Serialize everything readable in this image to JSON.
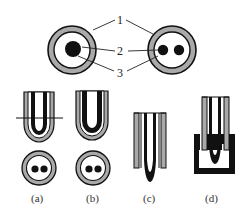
{
  "figure": {
    "callouts": {
      "one": "1",
      "two": "2",
      "three": "3"
    },
    "captions": {
      "a": "(a)",
      "b": "(b)",
      "c": "(c)",
      "d": "(d)"
    },
    "colors": {
      "outer_ring": "#a9a9a9",
      "stroke": "#111111",
      "background": "#ffffff"
    },
    "top_cross_sections": [
      {
        "name": "single-core",
        "cores": 1
      },
      {
        "name": "twin-core",
        "cores": 2
      }
    ]
  }
}
